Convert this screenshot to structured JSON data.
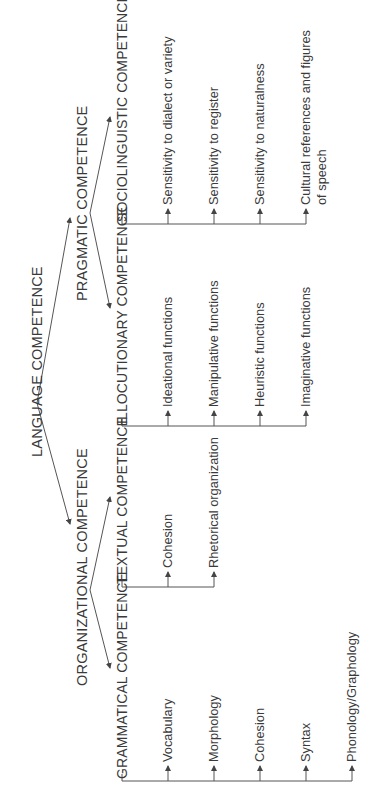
{
  "diagram": {
    "root": "LANGUAGE COMPETENCE",
    "level1": {
      "organizational": "ORGANIZATIONAL COMPETENCE",
      "pragmatic": "PRAGMATIC COMPETENCE"
    },
    "level2": {
      "grammatical": {
        "title": "GRAMMATICAL COMPETENCE",
        "items": [
          "Vocabulary",
          "Morphology",
          "Cohesion",
          "Syntax",
          "Phonology/Graphology"
        ]
      },
      "textual": {
        "title": "TEXTUAL COMPETENCE",
        "items": [
          "Cohesion",
          "Rhetorical organization"
        ]
      },
      "illocutionary": {
        "title": "ILLOCUTIONARY COMPETENCE",
        "items": [
          "Ideational functions",
          "Manipulative functions",
          "Heuristic functions",
          "Imaginative functions"
        ]
      },
      "sociolinguistic": {
        "title": "SOCIOLINGUISTIC COMPETENCE",
        "items": [
          "Sensitivity to dialect or variety",
          "Sensitivity to register",
          "Sensitivity to naturalness",
          "Cultural references and figures",
          "of speech"
        ]
      }
    },
    "colors": {
      "line": "#555555",
      "text": "#3a3a3a",
      "background": "#ffffff"
    }
  }
}
